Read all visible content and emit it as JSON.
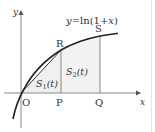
{
  "figure": {
    "curve_label": "y=ln(1+x)",
    "curve_label_parts": {
      "lhs": "y",
      "eq": "=ln(1+",
      "var": "x",
      "close": ")"
    },
    "axis_x_label": "x",
    "axis_y_label": "y",
    "origin_label": "O",
    "points": {
      "P": "P",
      "Q": "Q",
      "R": "R",
      "S": "S"
    },
    "regions": {
      "S1": {
        "main": "S",
        "sub": "1",
        "arg": "(t)"
      },
      "S2": {
        "main": "S",
        "sub": "2",
        "arg": "(t)"
      }
    },
    "colors": {
      "axis": "#888888",
      "curve": "#222222",
      "fill": "#f0f0f0",
      "text": "#333333"
    }
  }
}
